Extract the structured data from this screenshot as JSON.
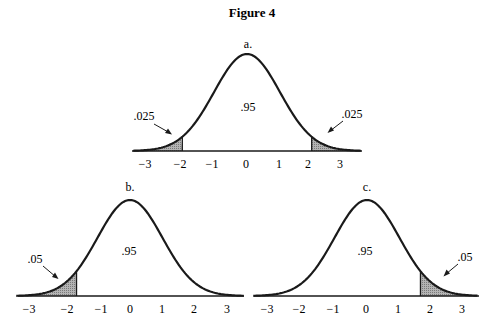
{
  "figure": {
    "title": "Figure 4"
  },
  "chart_data": [
    {
      "type": "area",
      "panel": "a.",
      "title": "a.",
      "distribution": "standard normal",
      "x_ticks": [
        "−3",
        "−2",
        "−1",
        "0",
        "1",
        "2",
        "3"
      ],
      "xlim": [
        -3.5,
        3.5
      ],
      "center_area_label": ".95",
      "shaded_regions": [
        {
          "from": -3.5,
          "to": -1.96,
          "label": ".025"
        },
        {
          "from": 1.96,
          "to": 3.5,
          "label": ".025"
        }
      ]
    },
    {
      "type": "area",
      "panel": "b.",
      "title": "b.",
      "distribution": "standard normal",
      "x_ticks": [
        "−3",
        "−2",
        "−1",
        "0",
        "1",
        "2",
        "3"
      ],
      "xlim": [
        -3.5,
        3.5
      ],
      "center_area_label": ".95",
      "shaded_regions": [
        {
          "from": -3.5,
          "to": -1.645,
          "label": ".05"
        }
      ]
    },
    {
      "type": "area",
      "panel": "c.",
      "title": "c.",
      "distribution": "standard normal",
      "x_ticks": [
        "−3",
        "−2",
        "−1",
        "0",
        "1",
        "2",
        "3"
      ],
      "xlim": [
        -3.5,
        3.5
      ],
      "center_area_label": ".95",
      "shaded_regions": [
        {
          "from": 1.645,
          "to": 3.5,
          "label": ".05"
        }
      ]
    }
  ],
  "panels": {
    "a": {
      "label": "a.",
      "center": ".95",
      "left_tail": ".025",
      "right_tail": ".025",
      "ticks": [
        "−3",
        "−2",
        "−1",
        "0",
        "1",
        "2",
        "3"
      ]
    },
    "b": {
      "label": "b.",
      "center": ".95",
      "left_tail": ".05",
      "ticks": [
        "−3",
        "−2",
        "−1",
        "0",
        "1",
        "2",
        "3"
      ]
    },
    "c": {
      "label": "c.",
      "center": ".95",
      "right_tail": ".05",
      "ticks": [
        "−3",
        "−2",
        "−1",
        "0",
        "1",
        "2",
        "3"
      ]
    }
  },
  "colors": {
    "ink": "#1a1a1a",
    "shade": "#a8a8a8",
    "background": "#ffffff"
  }
}
